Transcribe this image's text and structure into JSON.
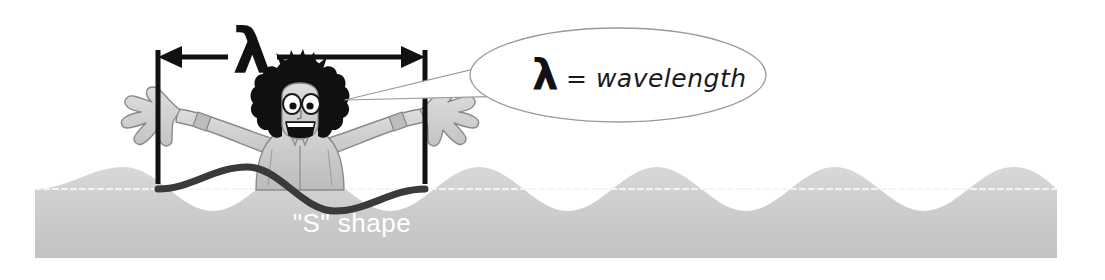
{
  "figure": {
    "background_color": "#ffffff"
  },
  "dimension": {
    "lambda_symbol": "λ",
    "arrow_color": "#111111",
    "left_tick_x": 158,
    "right_tick_x": 425,
    "arrow_y": 57
  },
  "callout": {
    "lambda_symbol": "λ",
    "equals_text": "= wavelength",
    "outline_color": "#9a9a9a",
    "fill_color": "#ffffff"
  },
  "wave": {
    "label": "\"S\" shape",
    "label_color": "#ffffff",
    "body_color_top": "#d2d2d2",
    "body_color_bottom": "#c4c4c4",
    "baseline_color": "#f2f2f2",
    "highlight_curve_color": "#3a3a3a",
    "baseline_y": 189,
    "amplitude": 22,
    "wavelength": 267
  },
  "character": {
    "name": "cartoon-surfer",
    "hair_color": "#111111",
    "skin_color": "#cfcfcf",
    "shirt_color": "#c6c6c6",
    "outline_color": "#7b7b7b"
  }
}
